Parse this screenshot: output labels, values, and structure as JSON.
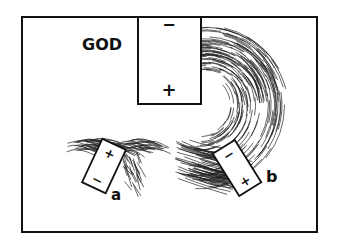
{
  "title_label": "GOD",
  "main_battery": {
    "top_sign": "−",
    "bottom_sign": "+"
  },
  "battery_a": {
    "label": "a",
    "top_sign": "+",
    "bottom_sign": "−"
  },
  "battery_b": {
    "label": "b",
    "top_sign": "−",
    "bottom_sign": "+"
  },
  "colors": {
    "ink": "#111111",
    "paper": "#ffffff"
  }
}
